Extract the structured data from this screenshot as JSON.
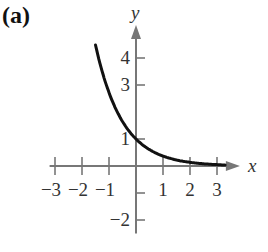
{
  "panel_label": "(a)",
  "chart_data": {
    "type": "line",
    "title": "",
    "panel": "(a)",
    "xlabel": "x",
    "ylabel": "y",
    "xlim": [
      -3.2,
      3.7
    ],
    "ylim": [
      -2.5,
      5.0
    ],
    "grid": false,
    "legend": null,
    "x_ticks": [
      -3,
      -2,
      -1,
      1,
      2,
      3
    ],
    "x_tick_labels": [
      "−3",
      "−2",
      "−1",
      "1",
      "2",
      "3"
    ],
    "y_ticks": [
      4,
      3,
      1,
      -1,
      -2
    ],
    "y_tick_labels": [
      "4",
      "3",
      "1",
      "",
      "−2"
    ],
    "series": [
      {
        "name": "f(x) = e^(-x)",
        "x": [
          -1.5,
          -1.25,
          -1.0,
          -0.75,
          -0.5,
          -0.25,
          0.0,
          0.25,
          0.5,
          0.75,
          1.0,
          1.5,
          2.0,
          2.5,
          3.0,
          3.3
        ],
        "y": [
          4.48,
          3.49,
          2.72,
          2.12,
          1.65,
          1.28,
          1.0,
          0.78,
          0.61,
          0.47,
          0.37,
          0.22,
          0.14,
          0.08,
          0.05,
          0.04
        ]
      }
    ]
  }
}
